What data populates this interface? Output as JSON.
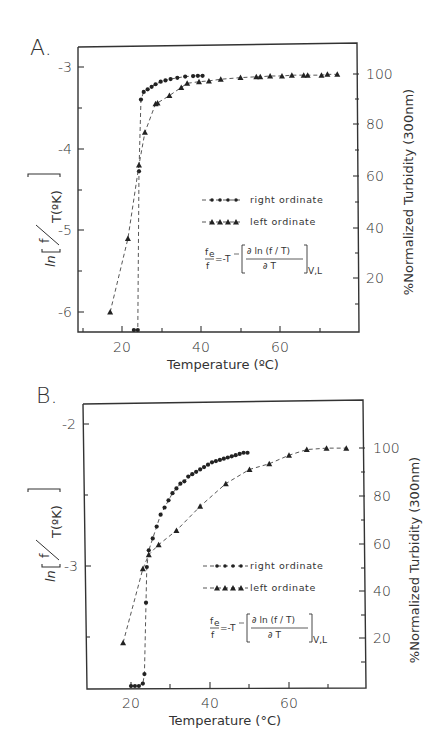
{
  "panels": [
    {
      "label": "A.",
      "x_axis": {
        "label": "Temperature (ºC)",
        "ticks": [
          "20",
          "40",
          "60"
        ]
      },
      "left_axis": {
        "label_ln": "ln",
        "label_frac_num": "f",
        "label_frac_den": "T(ºK)",
        "ticks": [
          "-3",
          "-4",
          "-5",
          "-6"
        ]
      },
      "right_axis": {
        "label": "%Normalized Turbidity (300nm)",
        "ticks": [
          "100",
          "80",
          "60",
          "40",
          "20"
        ]
      },
      "legend": [
        {
          "label": "right ordinate",
          "marker": "circle"
        },
        {
          "label": "left ordinate",
          "marker": "triangle"
        }
      ],
      "equation": {
        "lhs_num": "f",
        "lhs_sub": "e",
        "lhs_den": "f",
        "eq": "=-T",
        "rhs_num": "∂ ln (f / T)",
        "rhs_den": "∂ T",
        "subscript": "V,L"
      }
    },
    {
      "label": "B.",
      "x_axis": {
        "label": "Temperature (°C)",
        "ticks": [
          "20",
          "40",
          "60"
        ]
      },
      "left_axis": {
        "label_ln": "ln",
        "label_frac_num": "f",
        "label_frac_den": "T(ºK)",
        "ticks": [
          "-2",
          "-3"
        ]
      },
      "right_axis": {
        "label": "%Normalized Turbidity (300nm)",
        "ticks": [
          "100",
          "80",
          "60",
          "40",
          "20"
        ]
      },
      "legend": [
        {
          "label": "right ordinate",
          "marker": "circle"
        },
        {
          "label": "left ordinate",
          "marker": "triangle"
        }
      ],
      "equation": {
        "lhs_num": "f",
        "lhs_sub": "e",
        "lhs_den": "f",
        "eq": "=-T",
        "rhs_num": "∂ ln (f / T)",
        "rhs_den": "∂ T",
        "subscript": "V,L"
      }
    }
  ],
  "chart_data": [
    {
      "type": "scatter",
      "title": "A.",
      "xlabel": "Temperature (ºC)",
      "ylabel_left": "ln[f/T(ºK)]",
      "ylabel_right": "%Normalized Turbidity (300nm)",
      "xlim": [
        9,
        80
      ],
      "ylim_left": [
        -6.25,
        -2.75
      ],
      "ylim_right": [
        0,
        110
      ],
      "grid": false,
      "legend_position": "inside-center-right",
      "series": [
        {
          "name": "right ordinate",
          "marker": "circle",
          "axis": "right",
          "x": [
            23.0,
            24.0,
            24.3,
            24.8,
            25.5,
            26.5,
            27.5,
            28.5,
            29.8,
            31.0,
            32.3,
            34.0,
            36.0,
            38.0,
            39.2,
            40.4
          ],
          "y": [
            0,
            0,
            62,
            90,
            93,
            94,
            95,
            96,
            97,
            97.5,
            98,
            98.5,
            99,
            99.2,
            99.3,
            99.3
          ]
        },
        {
          "name": "left ordinate",
          "marker": "triangle",
          "axis": "left",
          "x": [
            17.0,
            21.5,
            24.3,
            25.8,
            28.5,
            29.0,
            32.0,
            35.0,
            36.5,
            39.5,
            42.0,
            45.0,
            50.0,
            54.0,
            55.0,
            57.5,
            60.5,
            63.0,
            66.0,
            67.0,
            70.5,
            72.0,
            74.5
          ],
          "y": [
            -6.0,
            -5.1,
            -4.2,
            -3.8,
            -3.45,
            -3.44,
            -3.35,
            -3.25,
            -3.2,
            -3.18,
            -3.17,
            -3.15,
            -3.13,
            -3.12,
            -3.12,
            -3.11,
            -3.11,
            -3.1,
            -3.1,
            -3.1,
            -3.1,
            -3.09,
            -3.09
          ]
        }
      ]
    },
    {
      "type": "scatter",
      "title": "B.",
      "xlabel": "Temperature (°C)",
      "ylabel_left": "ln[f/T(ºK)]",
      "ylabel_right": "%Normalized Turbidity (300nm)",
      "xlim": [
        8,
        79
      ],
      "ylim_left": [
        -3.85,
        -1.85
      ],
      "ylim_right": [
        0,
        110
      ],
      "grid": false,
      "legend_position": "inside-center-right",
      "series": [
        {
          "name": "right ordinate",
          "marker": "circle",
          "axis": "right",
          "x": [
            20.0,
            21.0,
            22.0,
            23.0,
            23.4,
            23.8,
            24.0,
            24.5,
            25.5,
            26.5,
            27.5,
            28.5,
            29.5,
            30.5,
            31.5,
            32.5,
            33.5,
            34.5,
            35.5,
            36.5,
            37.5,
            38.5,
            39.5,
            40.5,
            41.5,
            42.5,
            43.5,
            44.5,
            45.5,
            46.5,
            47.5,
            48.5,
            49.5
          ],
          "y": [
            0,
            0,
            0,
            1,
            5,
            35,
            50,
            57,
            62,
            67,
            72,
            75,
            78,
            81,
            83,
            85,
            86,
            88,
            89,
            90,
            91,
            92,
            93,
            94,
            94.5,
            95,
            95.5,
            96,
            96.5,
            97,
            97.5,
            98,
            98
          ]
        },
        {
          "name": "left ordinate",
          "marker": "triangle",
          "axis": "left",
          "x": [
            18.0,
            23.0,
            24.5,
            27.0,
            31.5,
            37.5,
            44.0,
            50.0,
            55.0,
            60.0,
            64.5,
            69.5,
            74.5
          ],
          "y": [
            -3.54,
            -3.02,
            -2.92,
            -2.85,
            -2.75,
            -2.58,
            -2.42,
            -2.32,
            -2.28,
            -2.22,
            -2.18,
            -2.17,
            -2.17
          ]
        }
      ]
    }
  ]
}
